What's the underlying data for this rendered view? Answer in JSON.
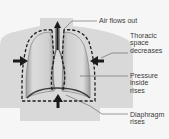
{
  "diagram": {
    "labels": {
      "air": "Air flows out",
      "thoracic": "Thoracic\nspace\ndecreases",
      "pressure": "Pressure\ninside\nrises",
      "diaphragm": "Diaphragm\nrises"
    },
    "colors": {
      "background": "#f6f6f6",
      "torso": "#d9d9d9",
      "lung_light": "#e4e4e4",
      "lung_dark": "#a9a9a9",
      "outline": "#1e1e1e",
      "arrow": "#1a1a1a",
      "leader": "#5a5a5a"
    }
  }
}
